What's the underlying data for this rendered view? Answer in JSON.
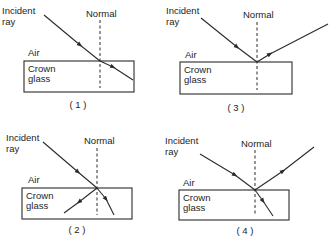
{
  "labels": {
    "incident_line1": "Incident",
    "incident_line2": "ray",
    "normal": "Normal",
    "air": "Air",
    "glass_line1": "Crown",
    "glass_line2": "glass"
  },
  "diagrams": [
    {
      "id": 1,
      "caption": "( 1 )",
      "description": "Incident ray refracts into crown glass bending away from the normal (incorrect)"
    },
    {
      "id": 2,
      "caption": "( 2 )",
      "description": "Incident ray splits into two rays inside the glass (incorrect)"
    },
    {
      "id": 3,
      "caption": "( 3 )",
      "description": "Incident ray is reflected only, no refraction"
    },
    {
      "id": 4,
      "caption": "( 4 )",
      "description": "Incident ray is partially reflected and partially refracted toward the normal"
    }
  ],
  "colors": {
    "line": "#2a2a2a",
    "text": "#1e1e1e",
    "background": "#ffffff"
  }
}
